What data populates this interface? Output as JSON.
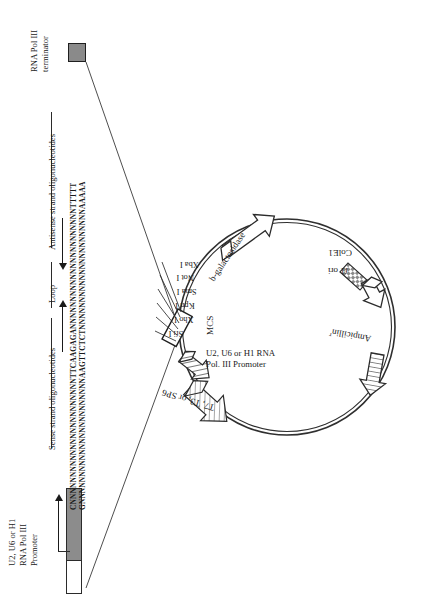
{
  "figure": {
    "type": "plasmid-map-with-expanded-insert",
    "orientation": "rotated-90-degrees"
  },
  "linear_construct": {
    "left_labels": {
      "promoter": "U2, U6 or H1\nRNA Pol III\nPromoter",
      "promoter_line1": "U2, U6 or H1",
      "promoter_line2": "RNA Pol III",
      "promoter_line3": "Promoter"
    },
    "right_labels": {
      "terminator_line1": "RNA Pol III",
      "terminator_line2": "terminator"
    },
    "span_labels": {
      "sense": "Sense strand oligonucleotides",
      "loop": "Loop",
      "antisense": "Antisense strand oligonucleotides"
    },
    "sequences": {
      "sense_strand": "CNNNNNNNNNNNNNNNNNNNNNNNTTCAAGAGANNNNNNNNNNNNNNNNNNNNNNTTTTT",
      "antisense_strand": "GNNNNNNNNNNNNNNNNNNNNNNNAAGTTCTCTNNNNNNNNNNNNNNNNNNNNNNAAAAA"
    }
  },
  "plasmid": {
    "features": [
      {
        "name": "b-galactosidase",
        "label": "b-galactosidase",
        "fill": "white"
      },
      {
        "name": "ColE1",
        "label": "ColE1",
        "fill": "checkered"
      },
      {
        "name": "f1-ori",
        "label": "f1 ori",
        "fill": "white"
      },
      {
        "name": "Ampicillin-resistance",
        "label": "Ampicillin",
        "superscript": "r",
        "fill": "striped"
      },
      {
        "name": "T7-T3-SP6-promoter",
        "label": "T7, T3, or SP6",
        "fill": "hatched"
      },
      {
        "name": "pol-III-promoter",
        "label": "U2, U6 or H1 RNA Pol. III Promoter",
        "label_line1": "U2, U6 or H1 RNA",
        "label_line2": "Pol. III Promoter",
        "fill": "hatched"
      },
      {
        "name": "MCS",
        "label": "MCS",
        "fill": "white"
      }
    ],
    "restriction_sites": [
      "Xba I",
      "Not I",
      "Sma I",
      "Kpn I",
      "Xho I",
      "Sfi I"
    ]
  },
  "colors": {
    "ink": "#1a1a1a",
    "promoter_fill": "#8c8c8c",
    "terminator_fill": "#8a8a8a",
    "line": "#2b2b2b",
    "background": "#ffffff"
  }
}
